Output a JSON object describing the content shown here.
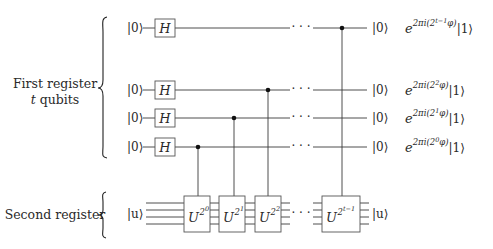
{
  "figure": {
    "type": "quantum-circuit"
  },
  "registers": {
    "first": {
      "label_line1": "First register",
      "label_line2_var": "t",
      "label_line2_rest": " qubits"
    },
    "second": {
      "label": "Second register"
    }
  },
  "first_register_rows": [
    {
      "input": "|0⟩",
      "gate": "H",
      "output": "|0⟩",
      "phase_exp": "2πi(2",
      "phase_sup": "t−1",
      "phase_tail": "φ)",
      "phase_ket": "|1⟩"
    },
    {
      "input": "|0⟩",
      "gate": "H",
      "output": "|0⟩",
      "phase_exp": "2πi(2",
      "phase_sup": "2",
      "phase_tail": "φ)",
      "phase_ket": "|1⟩"
    },
    {
      "input": "|0⟩",
      "gate": "H",
      "output": "|0⟩",
      "phase_exp": "2πi(2",
      "phase_sup": "1",
      "phase_tail": "φ)",
      "phase_ket": "|1⟩"
    },
    {
      "input": "|0⟩",
      "gate": "H",
      "output": "|0⟩",
      "phase_exp": "2πi(2",
      "phase_sup": "0",
      "phase_tail": "φ)",
      "phase_ket": "|1⟩"
    }
  ],
  "second_register": {
    "input": "|u⟩",
    "output": "|u⟩"
  },
  "controlled_gates": [
    {
      "base": "U",
      "exp_base": "2",
      "exp_sup": "0"
    },
    {
      "base": "U",
      "exp_base": "2",
      "exp_sup": "1"
    },
    {
      "base": "U",
      "exp_base": "2",
      "exp_sup": "2"
    },
    {
      "base": "U",
      "exp_base": "2",
      "exp_sup": "t−1"
    }
  ],
  "symbols": {
    "ellipsis": "· · ·",
    "e": "e"
  }
}
